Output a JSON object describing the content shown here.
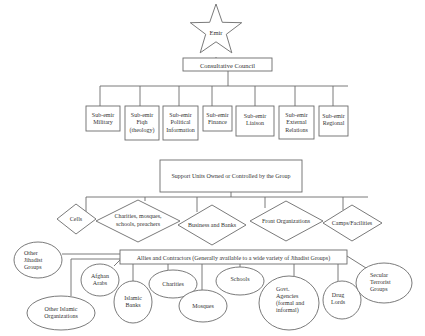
{
  "colors": {
    "line": "#6b6b6b",
    "text": "#333333",
    "background": "#ffffff"
  },
  "emir": {
    "label": "Emir",
    "shape": "star"
  },
  "council": {
    "label": "Consultative Council"
  },
  "sub_emirs": [
    {
      "lines": [
        "Sub-emir",
        "Military"
      ]
    },
    {
      "lines": [
        "Sub-emir",
        "Fiqh",
        "(theology)"
      ]
    },
    {
      "lines": [
        "Sub-emir",
        "Political",
        "Information"
      ]
    },
    {
      "lines": [
        "Sub-emir",
        "Finance"
      ]
    },
    {
      "lines": [
        "Sub-emir",
        "Liaison"
      ]
    },
    {
      "lines": [
        "Sub-emir",
        "External",
        "Relations"
      ]
    },
    {
      "lines": [
        "Sub-emir",
        "Regional"
      ]
    }
  ],
  "support": {
    "label": "Support Units Owned or Controlled by the Group"
  },
  "support_units": [
    {
      "lines": [
        "Cells"
      ]
    },
    {
      "lines": [
        "Charities, mosques,",
        "schools, preachers"
      ]
    },
    {
      "lines": [
        "Business and Banks"
      ]
    },
    {
      "lines": [
        "Front Organizations"
      ]
    },
    {
      "lines": [
        "Camps/Facilities"
      ]
    }
  ],
  "allies": {
    "label": "Allies and Contractors (Generally available to a wide variety of Jihadist Groups)"
  },
  "ally_types": [
    {
      "lines": [
        "Other",
        "Jihadist",
        "Groups"
      ]
    },
    {
      "lines": [
        "Afghan",
        "Arabs"
      ]
    },
    {
      "lines": [
        "Other Islamic",
        "Organizations"
      ]
    },
    {
      "lines": [
        "Islamic",
        "Banks"
      ]
    },
    {
      "lines": [
        "Charities"
      ]
    },
    {
      "lines": [
        "Mosques"
      ]
    },
    {
      "lines": [
        "Schools"
      ]
    },
    {
      "lines": [
        "Govt.",
        "Agencies",
        "(formal and",
        "informal)"
      ]
    },
    {
      "lines": [
        "Drug",
        "Lords"
      ]
    },
    {
      "lines": [
        "Secular",
        "Terrorist",
        "Groups"
      ]
    }
  ]
}
